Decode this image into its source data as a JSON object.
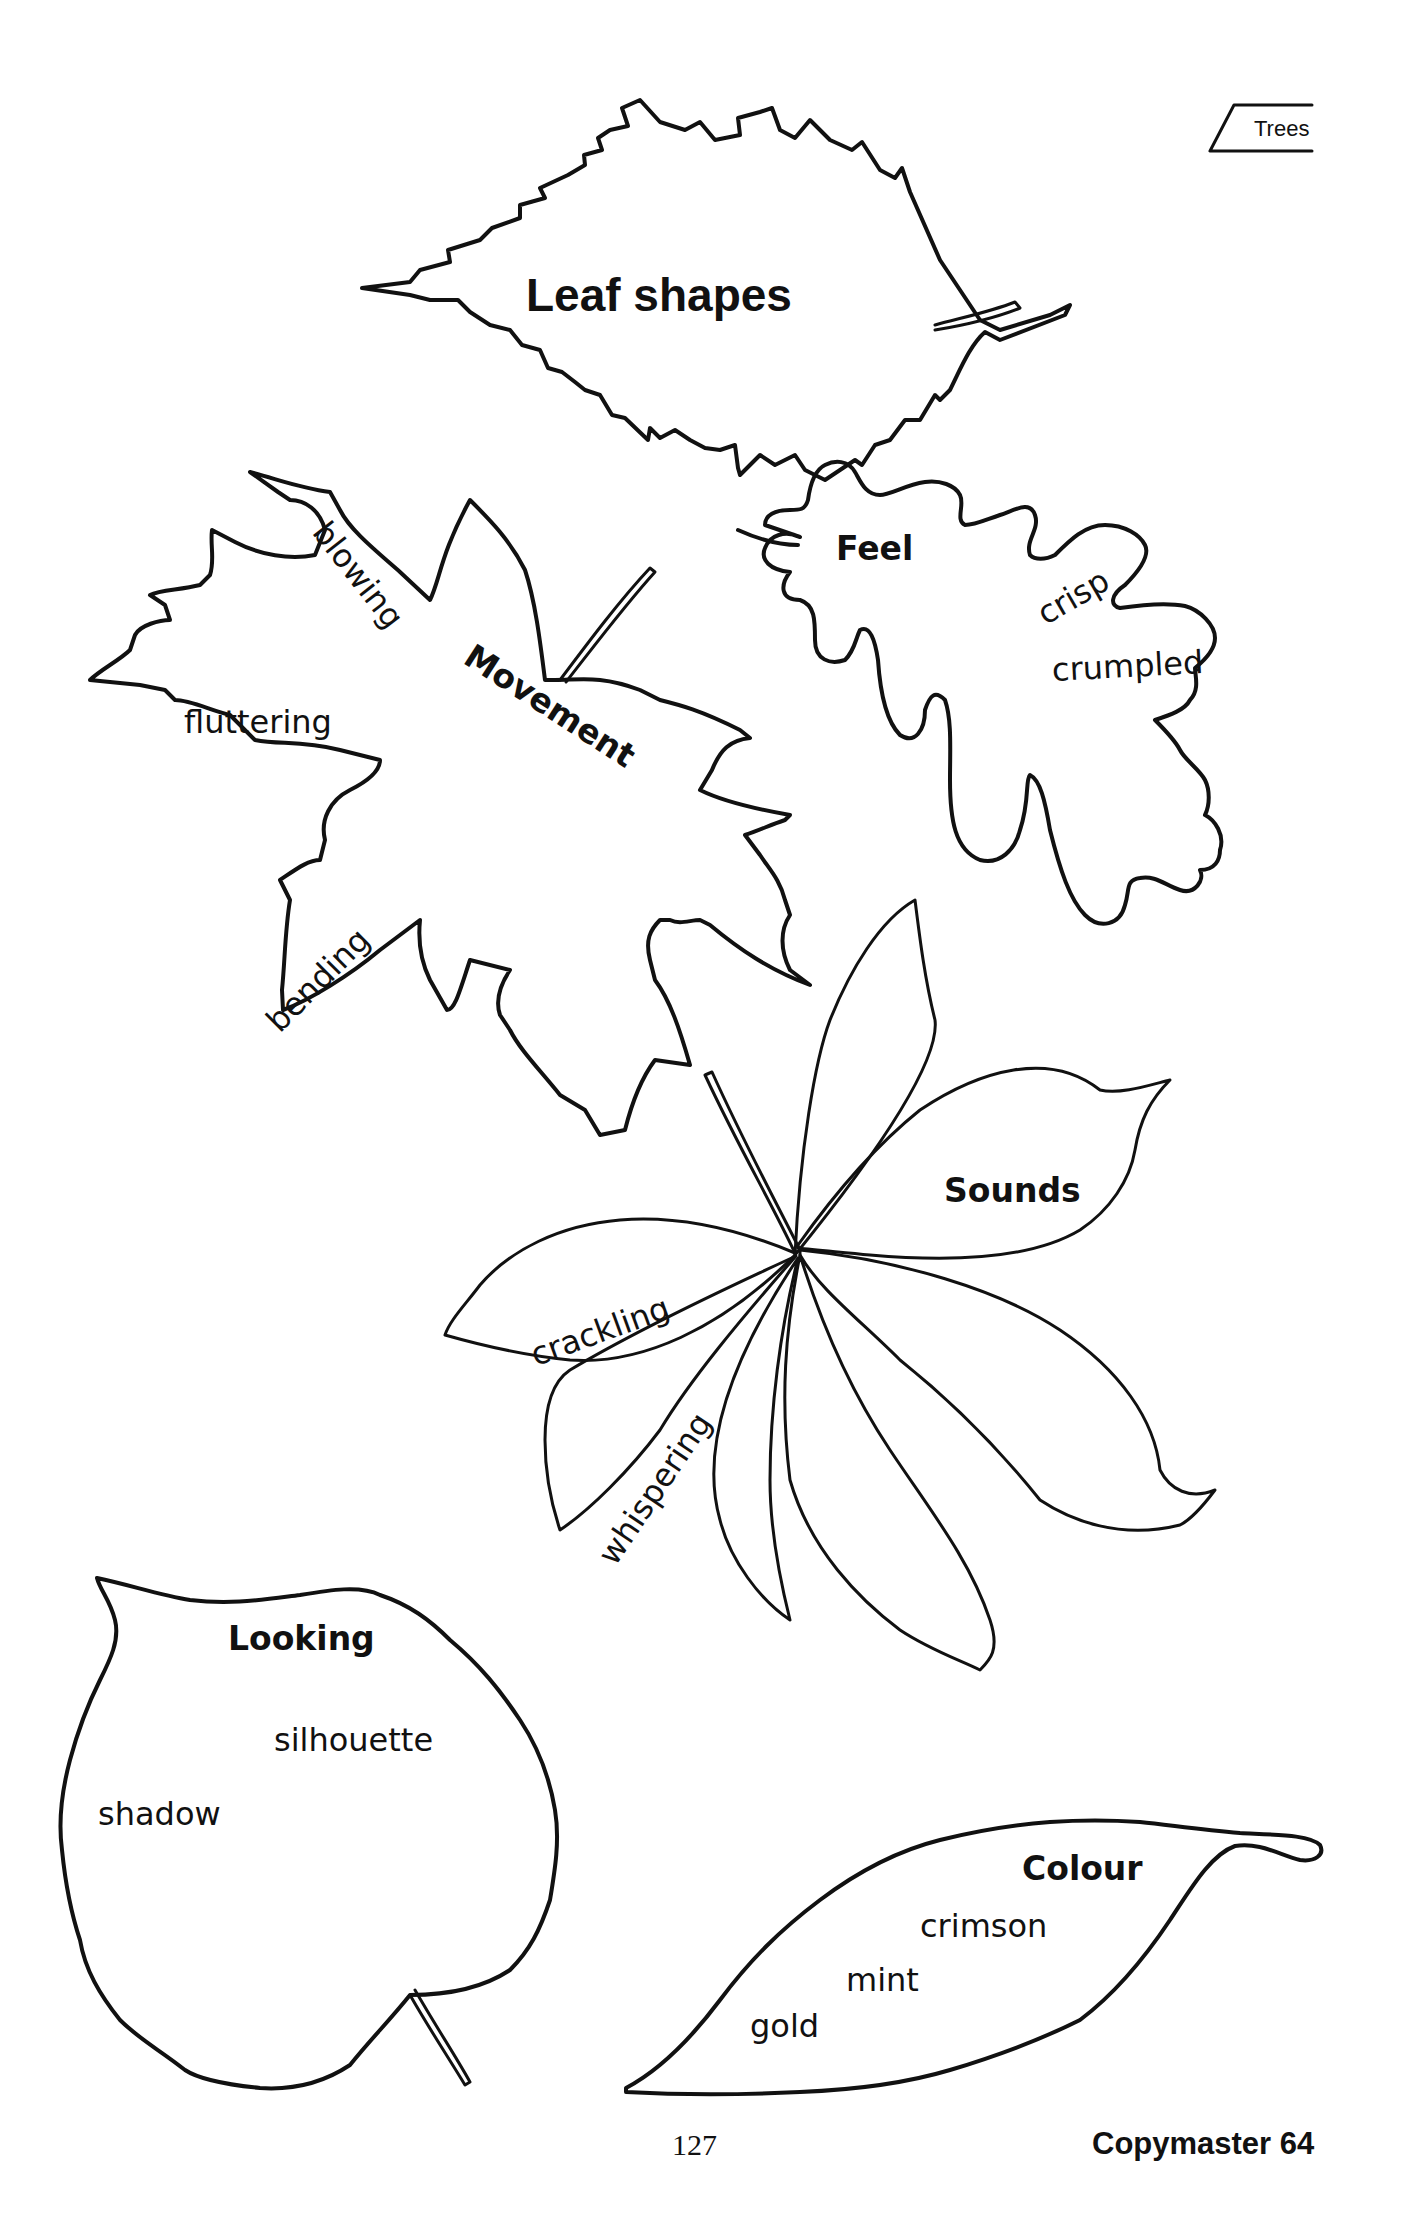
{
  "header": {
    "section_tab": "Trees"
  },
  "title": "Leaf shapes",
  "leaves": {
    "movement": {
      "heading": "Movement",
      "words": [
        "blowing",
        "fluttering",
        "bending"
      ]
    },
    "feel": {
      "heading": "Feel",
      "words": [
        "crisp",
        "crumpled"
      ]
    },
    "sounds": {
      "heading": "Sounds",
      "words": [
        "crackling",
        "whispering"
      ]
    },
    "looking": {
      "heading": "Looking",
      "words": [
        "silhouette",
        "shadow"
      ]
    },
    "colour": {
      "heading": "Colour",
      "words": [
        "crimson",
        "mint",
        "gold"
      ]
    }
  },
  "footer": {
    "page_number": "127",
    "copymaster": "Copymaster 64"
  }
}
